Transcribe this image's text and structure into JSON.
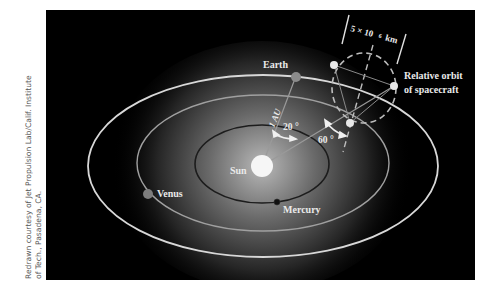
{
  "credit": {
    "line1": "Redrawn courtesy of Jet Propulsion Lab/Calif. Institute",
    "line2": "of Tech., Pasadena, CA."
  },
  "diagram": {
    "labels": {
      "sun": "Sun",
      "mercury": "Mercury",
      "venus": "Venus",
      "earth": "Earth",
      "distance": "1 AU",
      "angle1": "20 °",
      "angle2": "60 °",
      "scale": "5 × 10",
      "scale_exp": "6",
      "scale_unit": "km",
      "orbit_line1": "Relative orbit",
      "orbit_line2": "of spacecraft"
    },
    "colors": {
      "background": "#000000",
      "orbit_earth": "#d8d8d8",
      "orbit_venus": "#9a9a9a",
      "orbit_mercury": "#1a1a1a",
      "sun": "#f4f4f4",
      "planet": "#8a8a8a"
    }
  }
}
